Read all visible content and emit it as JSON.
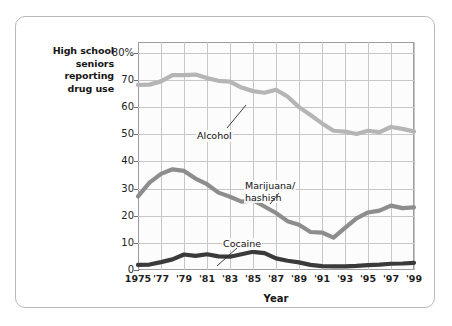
{
  "figure": {
    "y_axis_caption": "High school\nseniors\nreporting\ndrug use",
    "x_axis_title": "Year"
  },
  "chart_data": {
    "type": "line",
    "title": "",
    "xlabel": "Year",
    "ylabel": "High school seniors reporting drug use",
    "xlim": [
      1975,
      1999
    ],
    "ylim": [
      0,
      84
    ],
    "grid": true,
    "legend": "inline-annotations",
    "x_tick_labels": [
      "1975",
      "'77",
      "'79",
      "'81",
      "'83",
      "'85",
      "'87",
      "'89",
      "'91",
      "'93",
      "'95",
      "'97",
      "'99"
    ],
    "x_tick_values": [
      1975,
      1977,
      1979,
      1981,
      1983,
      1985,
      1987,
      1989,
      1991,
      1993,
      1995,
      1997,
      1999
    ],
    "y_tick_labels": [
      "0",
      "10",
      "20",
      "30",
      "40",
      "50",
      "60",
      "70",
      "80%"
    ],
    "y_tick_values": [
      0,
      10,
      20,
      30,
      40,
      50,
      60,
      70,
      80
    ],
    "x": [
      1975,
      1976,
      1977,
      1978,
      1979,
      1980,
      1981,
      1982,
      1983,
      1984,
      1985,
      1986,
      1987,
      1988,
      1989,
      1990,
      1991,
      1992,
      1993,
      1994,
      1995,
      1996,
      1997,
      1998,
      1999
    ],
    "series": [
      {
        "name": "Alcohol",
        "label": "Alcohol",
        "color": "#b5b5b5",
        "values": [
          68.2,
          68.3,
          69.5,
          71.8,
          71.8,
          72.0,
          70.7,
          69.7,
          69.4,
          67.2,
          65.9,
          65.3,
          66.4,
          63.9,
          60.0,
          57.1,
          54.0,
          51.3,
          51.0,
          50.1,
          51.3,
          50.8,
          52.7,
          52.0,
          51.0
        ]
      },
      {
        "name": "Marijuana/hashish",
        "label": "Marijuana/\nhashish",
        "color": "#8d8d8d",
        "values": [
          27.1,
          32.2,
          35.4,
          37.1,
          36.5,
          33.7,
          31.6,
          28.5,
          27.0,
          25.2,
          25.7,
          23.4,
          21.0,
          18.0,
          16.7,
          14.0,
          13.8,
          11.9,
          15.5,
          19.0,
          21.2,
          21.9,
          23.7,
          22.8,
          23.1
        ]
      },
      {
        "name": "Cocaine",
        "label": "Cocaine",
        "color": "#3a3a3a",
        "values": [
          1.9,
          2.0,
          2.9,
          3.9,
          5.7,
          5.2,
          5.8,
          5.0,
          4.9,
          5.8,
          6.7,
          6.2,
          4.3,
          3.4,
          2.8,
          1.9,
          1.4,
          1.3,
          1.3,
          1.5,
          1.8,
          2.0,
          2.3,
          2.4,
          2.6
        ]
      }
    ]
  }
}
